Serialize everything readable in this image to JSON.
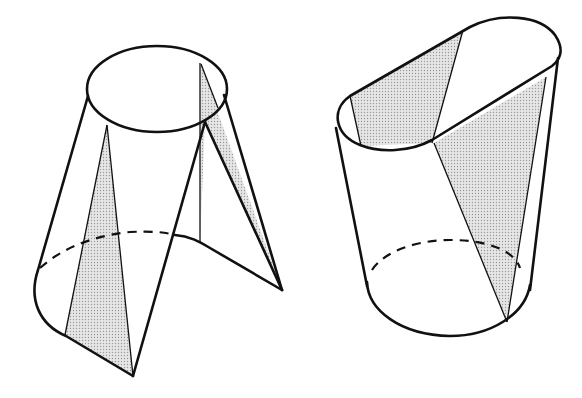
{
  "figure": {
    "type": "line-drawing",
    "colors": {
      "line": "#111111",
      "shade": "#cfcfcf",
      "background": "#ffffff"
    },
    "shapes": [
      {
        "id": "left",
        "name": "truncated conical shell cut by slanted curve",
        "top_outline": "ellipse",
        "bottom_outline": "partial ellipse with dashed hidden back edge",
        "shaded_regions": 2
      },
      {
        "id": "right",
        "name": "cylinder with obliquely cut stadium-shaped top",
        "top_outline": "stadium/oval tilted",
        "bottom_outline": "ellipse with dashed hidden back edge",
        "shaded_regions": 2
      }
    ]
  }
}
